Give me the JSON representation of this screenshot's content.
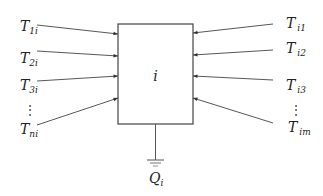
{
  "diagram": {
    "node": {
      "label": "i",
      "box": {
        "x": 118,
        "y": 24,
        "w": 75,
        "h": 100
      }
    },
    "colors": {
      "stroke": "#444444",
      "text": "#222222",
      "background": "#ffffff"
    },
    "left_inputs": [
      {
        "base": "T",
        "sub": "1i",
        "label_x": 20,
        "label_y": 31,
        "from": [
          37,
          25
        ],
        "to": [
          118,
          34
        ]
      },
      {
        "base": "T",
        "sub": "2i",
        "label_x": 20,
        "label_y": 63,
        "from": [
          37,
          51
        ],
        "to": [
          118,
          56
        ]
      },
      {
        "base": "T",
        "sub": "3i",
        "label_x": 20,
        "label_y": 90,
        "from": [
          37,
          81
        ],
        "to": [
          118,
          76
        ]
      },
      {
        "base": "T",
        "sub": "ni",
        "label_x": 20,
        "label_y": 134,
        "from": [
          37,
          125
        ],
        "to": [
          118,
          98
        ]
      }
    ],
    "left_ellipsis": {
      "text": "⋮",
      "x": 24,
      "y": 111
    },
    "right_inputs": [
      {
        "base": "T",
        "sub": "i1",
        "label_x": 286,
        "label_y": 28,
        "from": [
          273,
          24
        ],
        "to": [
          193,
          33
        ]
      },
      {
        "base": "T",
        "sub": "i2",
        "label_x": 286,
        "label_y": 53,
        "from": [
          273,
          50
        ],
        "to": [
          193,
          55
        ]
      },
      {
        "base": "T",
        "sub": "i3",
        "label_x": 286,
        "label_y": 90,
        "from": [
          273,
          80
        ],
        "to": [
          193,
          76
        ]
      },
      {
        "base": "T",
        "sub": "im",
        "label_x": 288,
        "label_y": 132,
        "from": [
          273,
          123
        ],
        "to": [
          193,
          98
        ]
      }
    ],
    "right_ellipsis": {
      "text": "⋮",
      "x": 290,
      "y": 111
    },
    "ground": {
      "label_base": "Q",
      "label_sub": "i",
      "x": 155.5,
      "wire_top": 124,
      "wire_bottom": 160
    }
  }
}
